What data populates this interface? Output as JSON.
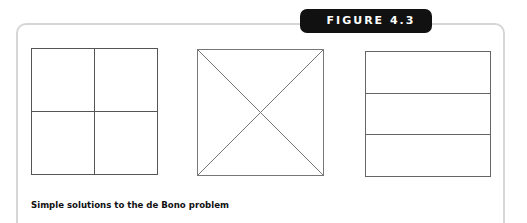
{
  "figure": {
    "label": "FIGURE 4.3",
    "caption": "Simple solutions to the de Bono problem",
    "colors": {
      "badge_bg": "#111111",
      "badge_text": "#ffffff",
      "frame_border": "#d6d6d6",
      "line": "#555555"
    },
    "diagrams": [
      {
        "name": "square-divided-into-four-quarters",
        "division": "vertical and horizontal midlines"
      },
      {
        "name": "square-divided-by-diagonals",
        "division": "two diagonals"
      },
      {
        "name": "square-divided-into-three-strips",
        "division": "two horizontal lines"
      }
    ]
  }
}
